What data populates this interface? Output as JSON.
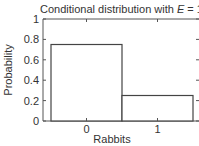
{
  "chart_data": {
    "type": "bar",
    "title": "Conditional distribution with E = 1",
    "title_parts": {
      "prefix": "Conditional distribution with ",
      "var": "E",
      "suffix": " = 1"
    },
    "xlabel": "Rabbits",
    "ylabel": "Probability",
    "categories": [
      "0",
      "1"
    ],
    "values": [
      0.75,
      0.25
    ],
    "ylim": [
      0,
      1
    ],
    "yticks": [
      "0",
      "0.2",
      "0.4",
      "0.6",
      "0.8",
      "1"
    ],
    "ytick_values": [
      0,
      0.2,
      0.4,
      0.6,
      0.8,
      1
    ],
    "grid": false,
    "legend": null,
    "bar_fill": "#ffffff",
    "bar_stroke": "#444444"
  }
}
